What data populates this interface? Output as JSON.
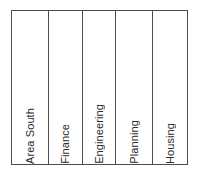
{
  "diagram": {
    "type": "column-band-diagram",
    "orientation": "vertical-text",
    "text_direction": "bottom-to-top",
    "border_color": "#4d4d4d",
    "background_color": "#ffffff",
    "text_color": "#2b2b2b",
    "columns": [
      {
        "label": "Area South"
      },
      {
        "label": "Finance"
      },
      {
        "label": "Engineering"
      },
      {
        "label": "Planning"
      },
      {
        "label": "Housing"
      }
    ]
  }
}
